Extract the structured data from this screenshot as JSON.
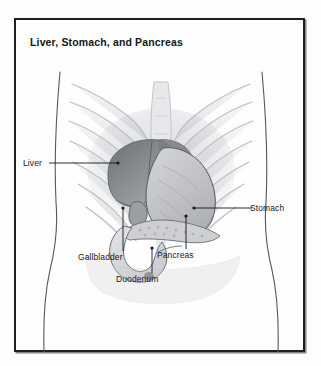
{
  "figure": {
    "title": "Liver, Stomach, and Pancreas",
    "type": "anatomical-illustration",
    "frame": {
      "border_color": "#1e1f24",
      "background": "#ffffff"
    },
    "page_background": "#fdfdfd",
    "ink_color": "#16171b",
    "labels": [
      {
        "id": "liver",
        "text": "Liver",
        "side": "left",
        "leader": "horizontal"
      },
      {
        "id": "stomach",
        "text": "Stomach",
        "side": "right",
        "leader": "horizontal"
      },
      {
        "id": "gallbladder",
        "text": "Gallbladder",
        "side": "bottom",
        "leader": "vertical"
      },
      {
        "id": "pancreas",
        "text": "Pancreas",
        "side": "bottom",
        "leader": "vertical"
      },
      {
        "id": "duodenum",
        "text": "Duodenum",
        "side": "bottom",
        "leader": "vertical"
      }
    ],
    "structures": [
      {
        "name": "rib-cage",
        "tone": "#e9eaec"
      },
      {
        "name": "sternum",
        "tone": "#e4e5e8"
      },
      {
        "name": "spine",
        "tone": "#dcdde0"
      },
      {
        "name": "liver",
        "tone": "#8d9094"
      },
      {
        "name": "stomach",
        "tone": "#c4c6c9"
      },
      {
        "name": "pancreas",
        "tone": "#cfd1d4"
      },
      {
        "name": "duodenum",
        "tone": "#d8dadd"
      },
      {
        "name": "gallbladder",
        "tone": "#a9acb0"
      },
      {
        "name": "torso-outline",
        "tone": "#5d6064"
      }
    ]
  }
}
